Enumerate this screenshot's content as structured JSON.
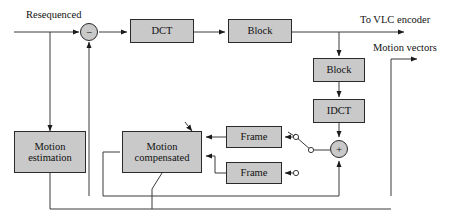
{
  "diagram": {
    "colors": {
      "block_fill": "#c9c9c9",
      "stroke": "#2a2a2a",
      "background": "#ffffff",
      "text": "#111111"
    },
    "blocks": [
      {
        "id": "dct",
        "name": "dct-block",
        "label": "DCT",
        "x": 130,
        "y": 19,
        "w": 64,
        "h": 24
      },
      {
        "id": "blk1",
        "name": "block-quantizer-block",
        "label": "Block",
        "x": 228,
        "y": 19,
        "w": 64,
        "h": 24
      },
      {
        "id": "blk2",
        "name": "block-dequantizer-block",
        "label": "Block",
        "x": 313,
        "y": 58,
        "w": 52,
        "h": 24
      },
      {
        "id": "idct",
        "name": "idct-block",
        "label": "IDCT",
        "x": 313,
        "y": 99,
        "w": 52,
        "h": 24
      },
      {
        "id": "frm1",
        "name": "frame-store-upper-block",
        "label": "Frame",
        "x": 226,
        "y": 126,
        "w": 56,
        "h": 22
      },
      {
        "id": "frm2",
        "name": "frame-store-lower-block",
        "label": "Frame",
        "x": 226,
        "y": 162,
        "w": 56,
        "h": 22
      },
      {
        "id": "mcomp",
        "name": "motion-compensated-block",
        "label_line1": "Motion",
        "label_line2": "compensated",
        "x": 122,
        "y": 131,
        "w": 80,
        "h": 42
      },
      {
        "id": "mest",
        "name": "motion-estimation-block",
        "label_line1": "Motion",
        "label_line2": "estimation",
        "x": 14,
        "y": 131,
        "w": 72,
        "h": 42
      }
    ],
    "junctions": [
      {
        "id": "sub",
        "name": "subtract-summing-junction",
        "symbol": "−",
        "cx": 89,
        "cy": 32,
        "r": 9
      },
      {
        "id": "add",
        "name": "add-summing-junction",
        "symbol": "+",
        "cx": 339,
        "cy": 149,
        "r": 9
      }
    ],
    "labels": [
      {
        "id": "resequenced",
        "name": "resequenced-input-label",
        "text": "Resequenced",
        "x": 26,
        "y": 9
      },
      {
        "id": "to_vlc",
        "name": "to-vlc-encoder-label",
        "text": "To VLC encoder",
        "x": 360,
        "y": 14
      },
      {
        "id": "motion_vec",
        "name": "motion-vectors-label",
        "text": "Motion vectors",
        "x": 373,
        "y": 42
      }
    ],
    "switch_nodes": [
      {
        "name": "switch-contact-upper-open",
        "cx": 296,
        "cy": 137,
        "r": 2.6
      },
      {
        "name": "switch-contact-mid-open",
        "cx": 311,
        "cy": 150,
        "r": 2.6
      },
      {
        "name": "switch-contact-lower-open",
        "cx": 296,
        "cy": 173,
        "r": 2.6
      }
    ]
  }
}
